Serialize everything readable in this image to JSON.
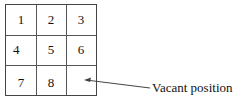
{
  "puzzle": {
    "cells": [
      "1",
      "2",
      "3",
      "4",
      "5",
      "6",
      "7",
      "8",
      ""
    ],
    "vacant_index": 8
  },
  "annotation": {
    "label": "Vacant position",
    "icon": "arrow-icon"
  }
}
